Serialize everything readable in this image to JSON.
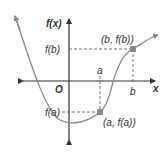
{
  "diagram": {
    "axis_labels": {
      "y": "f(x)",
      "x": "x",
      "origin": "O"
    },
    "tick_labels": {
      "a": "a",
      "b": "b",
      "fa": "f(a)",
      "fb": "f(b)"
    },
    "points": [
      {
        "label": "(a, f(a))",
        "x": 100,
        "y": 112
      },
      {
        "label": "(b, f(b))",
        "x": 133,
        "y": 49
      }
    ],
    "colors": {
      "curve": "#8a8a8a",
      "axis": "#333333",
      "point": "#8a8a8a",
      "dash": "#555555"
    }
  }
}
